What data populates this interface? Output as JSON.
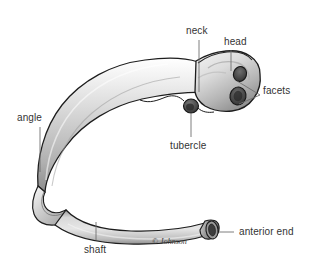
{
  "figure": {
    "view": "posterior-lateral view of a typical rib",
    "background_color": "#ffffff",
    "line_color": "#6f6f6f",
    "text_color": "#343434",
    "bone_outline_color": "#1b1b1b",
    "bone_fill_light": "#e8e8e8",
    "bone_fill_mid": "#c6c6c6",
    "bone_fill_dark": "#8e8e8e",
    "facet_color": "#4a4a4a"
  },
  "labels": [
    {
      "id": "neck",
      "text": "neck",
      "x": 186,
      "y": 26,
      "leader": {
        "x1": 199,
        "y1": 40,
        "x2": 199,
        "y2": 92
      }
    },
    {
      "id": "head",
      "text": "head",
      "x": 224,
      "y": 37,
      "leader": {
        "x1": 231,
        "y1": 50,
        "x2": 231,
        "y2": 71
      }
    },
    {
      "id": "facets",
      "text": "facets",
      "x": 263,
      "y": 91,
      "leader_upper": {
        "x1": 260,
        "y1": 95,
        "x2": 237,
        "y2": 81
      },
      "leader_lower": {
        "x1": 260,
        "y1": 95,
        "x2": 239,
        "y2": 104
      }
    },
    {
      "id": "tubercle",
      "text": "tubercle",
      "x": 170,
      "y": 141,
      "leader": {
        "x1": 191,
        "y1": 137,
        "x2": 191,
        "y2": 113
      }
    },
    {
      "id": "angle",
      "text": "angle",
      "x": 17,
      "y": 113,
      "leader": {
        "x1": 40,
        "y1": 127,
        "x2": 40,
        "y2": 172
      }
    },
    {
      "id": "shaft",
      "text": "shaft",
      "x": 84,
      "y": 245,
      "leader": {
        "x1": 96,
        "y1": 240,
        "x2": 96,
        "y2": 222
      }
    },
    {
      "id": "anterior-end",
      "text": "anterior end",
      "x": 239,
      "y": 228,
      "leader": {
        "x1": 234,
        "y1": 232,
        "x2": 219,
        "y2": 232
      }
    }
  ],
  "credit": {
    "text": "© Johnson",
    "x": 152,
    "y": 240
  }
}
